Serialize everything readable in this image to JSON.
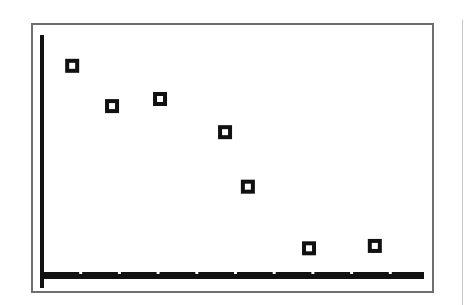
{
  "chart_data": {
    "type": "scatter",
    "title": "",
    "xlabel": "",
    "ylabel": "",
    "grid": false,
    "legend": null,
    "marker": "hollow-square",
    "x_ticks_count": 10,
    "x_tick_labels": [],
    "y_tick_labels": [],
    "xlim": [
      0,
      9.9
    ],
    "ylim": [
      0,
      100
    ],
    "points": [
      {
        "x": 0.78,
        "y": 87
      },
      {
        "x": 1.81,
        "y": 70
      },
      {
        "x": 3.05,
        "y": 73
      },
      {
        "x": 4.73,
        "y": 59
      },
      {
        "x": 5.32,
        "y": 36
      },
      {
        "x": 6.9,
        "y": 10
      },
      {
        "x": 8.6,
        "y": 11
      }
    ]
  },
  "colors": {
    "axis": "#111111",
    "marker": "#111111",
    "frame": "#6e6e6e",
    "background": "#ffffff"
  }
}
